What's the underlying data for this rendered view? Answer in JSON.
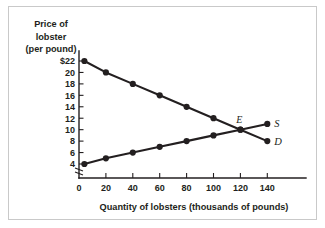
{
  "chart_data": {
    "type": "line",
    "title": "",
    "xlabel": "Quantity of lobsters (thousands of pounds)",
    "ylabel": "Price of lobster (per pound)",
    "ylabel_lines": [
      "Price of",
      "lobster",
      "(per pound)"
    ],
    "xlim": [
      0,
      150
    ],
    "ylim": [
      4,
      22
    ],
    "x_ticks": [
      0,
      20,
      40,
      60,
      80,
      100,
      120,
      140
    ],
    "x_tick_labels": [
      "0",
      "20",
      "40",
      "60",
      "80",
      "100",
      "120",
      "140"
    ],
    "y_ticks": [
      4,
      6,
      8,
      10,
      12,
      14,
      16,
      18,
      20,
      22
    ],
    "y_tick_labels": [
      "4",
      "6",
      "8",
      "10",
      "12",
      "14",
      "16",
      "18",
      "20",
      "$22"
    ],
    "grid": false,
    "axis_break_y": true,
    "legend_position": "inline-right",
    "series": [
      {
        "name": "D",
        "label": "D",
        "description": "Demand curve",
        "x": [
          4,
          20,
          40,
          60,
          80,
          100,
          120,
          140
        ],
        "values": [
          22,
          20,
          18,
          16,
          14,
          12,
          10,
          8
        ],
        "color": "#231f20"
      },
      {
        "name": "S",
        "label": "S",
        "description": "Supply curve",
        "x": [
          4,
          20,
          40,
          60,
          80,
          100,
          120,
          140
        ],
        "values": [
          4,
          5,
          6,
          7,
          8,
          9,
          10,
          11
        ],
        "color": "#231f20"
      }
    ],
    "annotations": [
      {
        "label": "E",
        "description": "Equilibrium point",
        "x": 120,
        "y": 10
      }
    ]
  },
  "frame": {
    "border_color": "#c9c9c9",
    "background": "#ffffff"
  }
}
